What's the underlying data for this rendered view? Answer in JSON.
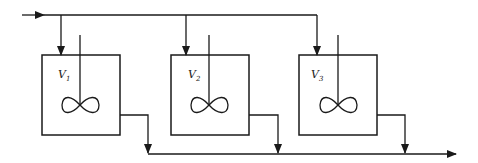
{
  "diagram": {
    "type": "process-flow",
    "colors": {
      "line": "#1a1a1a",
      "background": "#ffffff"
    },
    "feed_line": {
      "direction": "left-to-right",
      "arrow": "right-arrow-icon"
    },
    "product_line": {
      "direction": "left-to-right",
      "arrow": "right-arrow-icon"
    },
    "tanks": [
      {
        "label": "V",
        "subscript": "1",
        "agitator": "impeller-icon"
      },
      {
        "label": "V",
        "subscript": "2",
        "agitator": "impeller-icon"
      },
      {
        "label": "V",
        "subscript": "3",
        "agitator": "impeller-icon"
      }
    ]
  }
}
